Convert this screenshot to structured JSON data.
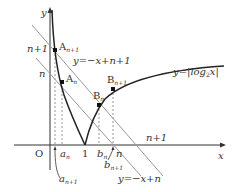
{
  "diagram": {
    "axes": {
      "x_label": "x",
      "y_label": "y",
      "origin_label": "O",
      "tick_one": "1"
    },
    "curve": {
      "label": "y=|log",
      "label_sub": "2",
      "label_tail": "x|"
    },
    "lines": {
      "upper": {
        "label": "y=−x+n+1",
        "intercept_label": "n+1",
        "x_intercept_label": "n+1"
      },
      "lower": {
        "label": "y=−x+n",
        "intercept_label": "n",
        "x_intercept_label": "n"
      }
    },
    "points": {
      "A_n1": {
        "label": "A",
        "sub": "n+1"
      },
      "A_n": {
        "label": "A",
        "sub": "n"
      },
      "B_n": {
        "label": "B",
        "sub": "n"
      },
      "B_n1": {
        "label": "B",
        "sub": "n+1"
      }
    },
    "x_marks": {
      "a_n": {
        "label": "a",
        "sub": "n"
      },
      "a_n1": {
        "label": "a",
        "sub": "n+1"
      },
      "b_n": {
        "label": "b",
        "sub": "n"
      },
      "b_n1": {
        "label": "b",
        "sub": "n+1"
      }
    },
    "colors": {
      "axis": "#333333",
      "curve": "#222222",
      "line": "#888888",
      "dash": "#999999"
    }
  }
}
